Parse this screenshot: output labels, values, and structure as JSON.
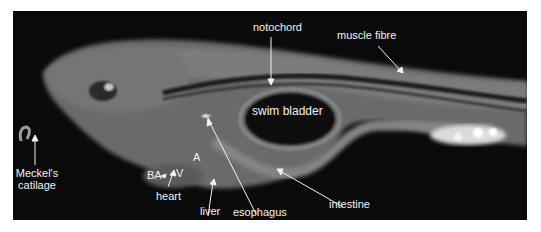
{
  "figure": {
    "background": "#0a0a0a",
    "label_color": "#f2f2f2",
    "labels": {
      "notochord": "notochord",
      "muscle_fibre": "muscle fibre",
      "swim_bladder": "swim bladder",
      "meckels_line1": "Meckel's",
      "meckels_line2": "catilage",
      "ba": "BA",
      "v": "V",
      "a": "A",
      "heart": "heart",
      "liver": "liver",
      "esophagus": "esophagus",
      "intestine": "intestine"
    }
  }
}
